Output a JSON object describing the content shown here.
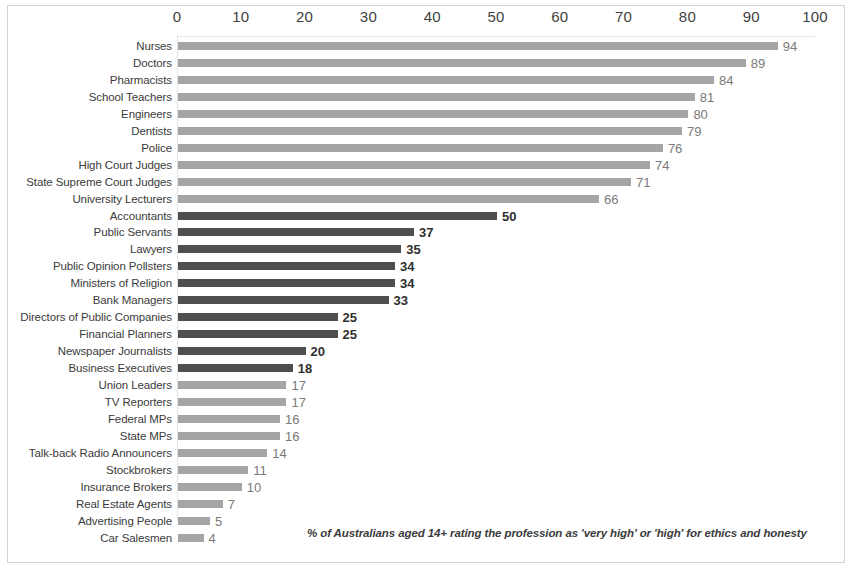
{
  "footnote": "% of Australians aged 14+ rating the profession as  'very high' or 'high' for ethics and honesty",
  "colors": {
    "bar_light": "#a5a5a5",
    "bar_dark": "#4f4f4f",
    "frame": "#d2d2d2",
    "axis": "#e4e4e4",
    "text": "#3b3b3b"
  },
  "chart_data": {
    "type": "bar",
    "orientation": "horizontal",
    "title": "",
    "subtitle": "",
    "xlabel": "",
    "ylabel": "",
    "xlim": [
      0,
      100
    ],
    "xticks": [
      0,
      10,
      20,
      30,
      40,
      50,
      60,
      70,
      80,
      90,
      100
    ],
    "grid": false,
    "legend": "none",
    "annotation": "% of Australians aged 14+ rating the profession as  'very high' or 'high' for ethics and honesty",
    "categories": [
      "Nurses",
      "Doctors",
      "Pharmacists",
      "School Teachers",
      "Engineers",
      "Dentists",
      "Police",
      "High Court Judges",
      "State Supreme Court Judges",
      "University Lecturers",
      "Accountants",
      "Public Servants",
      "Lawyers",
      "Public Opinion Pollsters",
      "Ministers of Religion",
      "Bank Managers",
      "Directors of Public Companies",
      "Financial Planners",
      "Newspaper Journalists",
      "Business Executives",
      "Union Leaders",
      "TV Reporters",
      "Federal MPs",
      "State MPs",
      "Talk-back Radio Announcers",
      "Stockbrokers",
      "Insurance Brokers",
      "Real Estate Agents",
      "Advertising People",
      "Car Salesmen"
    ],
    "values": [
      94,
      89,
      84,
      81,
      80,
      79,
      76,
      74,
      71,
      66,
      50,
      37,
      35,
      34,
      34,
      33,
      25,
      25,
      20,
      18,
      17,
      17,
      16,
      16,
      14,
      11,
      10,
      7,
      5,
      4
    ],
    "bar_styles": [
      "light",
      "light",
      "light",
      "light",
      "light",
      "light",
      "light",
      "light",
      "light",
      "light",
      "dark",
      "dark",
      "dark",
      "dark",
      "dark",
      "dark",
      "dark",
      "dark",
      "dark",
      "dark",
      "light",
      "light",
      "light",
      "light",
      "light",
      "light",
      "light",
      "light",
      "light",
      "light"
    ]
  }
}
